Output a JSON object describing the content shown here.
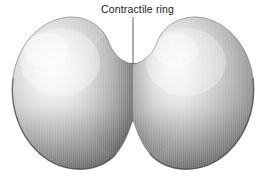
{
  "figure": {
    "background_color": "#ffffff",
    "width": 266,
    "height": 183
  },
  "annotations": [
    {
      "id": "contractile-ring",
      "label": "Contractile ring",
      "text_color": "#1a1a1a",
      "leader_line": {
        "x1": 133,
        "y1": 17,
        "x2": 133,
        "y2": 64,
        "color": "#5a5a5a",
        "width": 1
      }
    }
  ],
  "structures": {
    "left_lobe": {
      "name": "left daughter cell lobe",
      "center_x": 76,
      "center_y": 94,
      "radius_x": 64,
      "radius_y": 76,
      "highlight_color": "#f2f2f2",
      "midtone_color": "#c6c6c6",
      "shadow_color": "#8d8d8d",
      "edge_color": "#6d6d6d"
    },
    "right_lobe": {
      "name": "right daughter cell lobe",
      "center_x": 190,
      "center_y": 94,
      "radius_x": 64,
      "radius_y": 76,
      "highlight_color": "#f2f2f2",
      "midtone_color": "#c6c6c6",
      "shadow_color": "#8d8d8d",
      "edge_color": "#6a6a6a"
    },
    "ring": {
      "name": "contractile ring neck",
      "left_x": 116,
      "right_x": 152,
      "top_y": 64,
      "bottom_y": 120,
      "fiber_count": 5,
      "fiber_color": "#6f6f6f",
      "band_color": "#4a4a4a",
      "body_color": "#b4b4b4"
    }
  },
  "palette": {
    "white": "#ffffff",
    "highlight": "#f4f4f4",
    "light_gray": "#dcdcdc",
    "mid_gray": "#b0b0b0",
    "dark_gray": "#8a8a8a",
    "outline": "#5e5e5e",
    "text": "#1a1a1a"
  }
}
